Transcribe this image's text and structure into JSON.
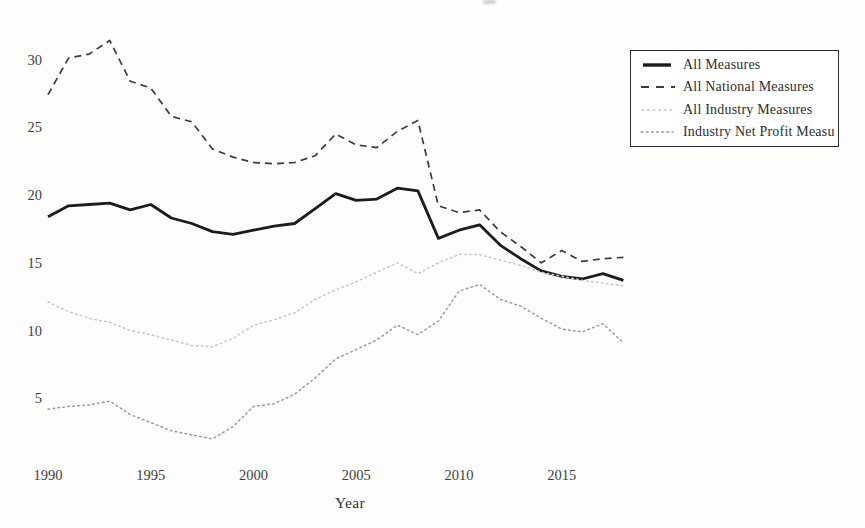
{
  "figure": {
    "background": "#fdfdfc",
    "text_color": "#3e3e3e"
  },
  "chart_data": {
    "type": "line",
    "title": "",
    "xlabel": "Year",
    "ylabel": "",
    "grid": false,
    "legend_position": "top-right",
    "ylim": [
      1.5,
      32.5
    ],
    "xlim": [
      1988.5,
      2019.5
    ],
    "yticks": [
      5,
      10,
      15,
      20,
      25,
      30
    ],
    "xticks": [
      1990,
      1995,
      2000,
      2005,
      2010,
      2015
    ],
    "x_years": [
      1990,
      1991,
      1992,
      1993,
      1994,
      1995,
      1996,
      1997,
      1998,
      1999,
      2000,
      2001,
      2002,
      2003,
      2004,
      2005,
      2006,
      2007,
      2008,
      2009,
      2010,
      2011,
      2012,
      2013,
      2014,
      2015,
      2016,
      2017,
      2018
    ],
    "series": [
      {
        "name": "All Measures",
        "style": "solid",
        "color": "#1c1c1c",
        "width": 2.8,
        "values": [
          18.4,
          19.2,
          19.3,
          19.4,
          18.9,
          19.3,
          18.3,
          17.9,
          17.3,
          17.1,
          17.4,
          17.7,
          17.9,
          19.0,
          20.1,
          19.6,
          19.7,
          20.5,
          20.3,
          16.8,
          17.4,
          17.8,
          16.3,
          15.3,
          14.4,
          14.0,
          13.8,
          14.2,
          13.7
        ]
      },
      {
        "name": "All National Measures",
        "style": "dashed",
        "color": "#3c3c3c",
        "width": 1.7,
        "values": [
          27.4,
          30.1,
          30.4,
          31.4,
          28.4,
          27.9,
          25.8,
          25.4,
          23.4,
          22.8,
          22.4,
          22.3,
          22.4,
          22.9,
          24.5,
          23.7,
          23.5,
          24.7,
          25.5,
          19.2,
          18.7,
          18.9,
          17.3,
          16.2,
          15.0,
          15.9,
          15.1,
          15.3,
          15.4
        ]
      },
      {
        "name": "All Industry Measures",
        "style": "dotted",
        "color": "#c8c8c8",
        "width": 1.5,
        "values": [
          12.1,
          11.4,
          10.9,
          10.6,
          10.0,
          9.7,
          9.3,
          8.9,
          8.8,
          9.4,
          10.4,
          10.8,
          11.3,
          12.3,
          13.0,
          13.6,
          14.3,
          15.0,
          14.2,
          15.0,
          15.6,
          15.6,
          15.2,
          14.8,
          14.3,
          14.0,
          13.7,
          13.5,
          13.3
        ]
      },
      {
        "name": "Industry Net Profit Measu",
        "style": "dotted",
        "color": "#9b9b9b",
        "width": 1.5,
        "values": [
          4.2,
          4.4,
          4.5,
          4.8,
          3.8,
          3.2,
          2.6,
          2.3,
          2.0,
          2.9,
          4.4,
          4.6,
          5.3,
          6.5,
          7.9,
          8.6,
          9.3,
          10.4,
          9.7,
          10.7,
          12.9,
          13.4,
          12.3,
          11.8,
          10.9,
          10.1,
          9.9,
          10.5,
          9.1
        ]
      }
    ]
  }
}
